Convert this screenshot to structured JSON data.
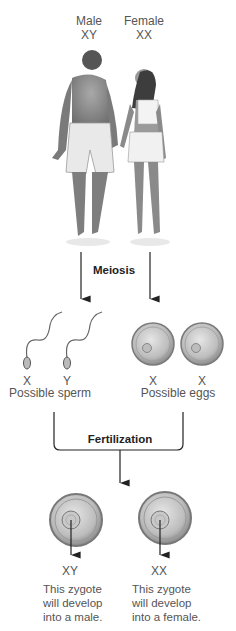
{
  "parents": {
    "male": {
      "label": "Male",
      "genotype": "XY"
    },
    "female": {
      "label": "Female",
      "genotype": "XX"
    }
  },
  "process1": {
    "label": "Meiosis"
  },
  "gametes": {
    "sperm": {
      "chromosomes": [
        "X",
        "Y"
      ],
      "label": "Possible sperm"
    },
    "eggs": {
      "chromosomes": [
        "X",
        "X"
      ],
      "label": "Possible eggs"
    }
  },
  "process2": {
    "label": "Fertilization"
  },
  "zygotes": [
    {
      "genotype": "XY",
      "caption": [
        "This zygote",
        "will develop",
        "into a male."
      ]
    },
    {
      "genotype": "XX",
      "caption": [
        "This zygote",
        "will develop",
        "into a female."
      ]
    }
  ],
  "colors": {
    "arrow": "#222222",
    "text": "#555555",
    "cell_rim": "#8a8a8a",
    "cell_fill": "#c9c9c9"
  }
}
